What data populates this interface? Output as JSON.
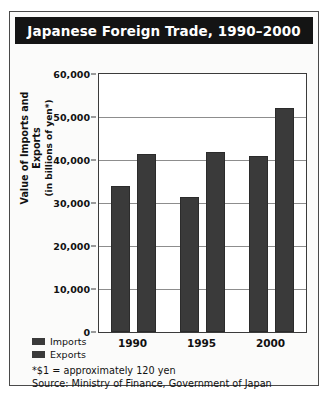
{
  "figure": {
    "title": "Japanese Foreign Trade, 1990–2000",
    "footnotes": [
      "*$1 = approximately 120 yen",
      "Source: Ministry of Finance, Government of Japan"
    ],
    "colors": {
      "title_bar": "#141414",
      "title_text": "#ffffff",
      "bar_fill": "#3a3a3a",
      "gridline": "#8d8d8d",
      "frame": "#4a4a4a",
      "plot_background": "#ffffff",
      "page_background": "#fbfbfa"
    }
  },
  "chart_data": {
    "type": "bar",
    "title": "Japanese Foreign Trade, 1990–2000",
    "xlabel": "",
    "ylabel": "Value of Imports and Exports (in billions of yen*)",
    "ylabel_line1": "Value of Imports and Exports",
    "ylabel_line2": "(in billions of yen*)",
    "categories": [
      "1990",
      "1995",
      "2000"
    ],
    "series": [
      {
        "name": "Imports",
        "values": [
          34000,
          31500,
          41000
        ]
      },
      {
        "name": "Exports",
        "values": [
          41500,
          41800,
          52000
        ]
      }
    ],
    "ylim": [
      0,
      60000
    ],
    "ytick_values": [
      0,
      10000,
      20000,
      30000,
      40000,
      50000,
      60000
    ],
    "ytick_labels": [
      "0",
      "10,000",
      "20,000",
      "30,000",
      "40,000",
      "50,000",
      "60,000"
    ],
    "grid": true,
    "grid_axis": "y",
    "legend": [
      "Imports",
      "Exports"
    ],
    "legend_position": "bottom-left"
  }
}
